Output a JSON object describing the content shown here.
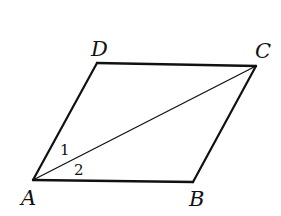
{
  "figure": {
    "type": "parallelogram",
    "vertices": {
      "A": {
        "label": "A",
        "x": 33,
        "y": 180
      },
      "B": {
        "label": "B",
        "x": 193,
        "y": 182
      },
      "C": {
        "label": "C",
        "x": 256,
        "y": 66
      },
      "D": {
        "label": "D",
        "x": 97,
        "y": 63
      }
    },
    "sides": [
      "AB",
      "BC",
      "CD",
      "DA"
    ],
    "diagonals": [
      "AC"
    ],
    "angle_labels": [
      {
        "label": "1",
        "at_vertex": "A",
        "between": [
          "AD",
          "AC"
        ]
      },
      {
        "label": "2",
        "at_vertex": "A",
        "between": [
          "AC",
          "AB"
        ]
      }
    ],
    "colors": {
      "stroke": "#111111",
      "background": "#ffffff"
    }
  }
}
